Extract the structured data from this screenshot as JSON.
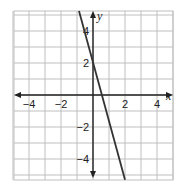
{
  "chart_data": {
    "type": "line",
    "title": "",
    "xlabel": "x",
    "ylabel": "y",
    "xlim": [
      -5,
      5
    ],
    "ylim": [
      -5.3,
      5.25
    ],
    "grid": true,
    "grid_step": 1,
    "x_ticks": [
      -4,
      -2,
      2,
      4
    ],
    "x_tick_labels": [
      "−4",
      "−2",
      "2",
      "4"
    ],
    "y_ticks": [
      4,
      2,
      -2,
      -4
    ],
    "y_tick_labels": [
      "4",
      "2",
      "−2",
      "−4"
    ],
    "series": [
      {
        "name": "line",
        "points": [
          [
            -0.875,
            5.25
          ],
          [
            0,
            2
          ],
          [
            0.57,
            0
          ],
          [
            2,
            -5.3
          ]
        ],
        "slope_approx": -3.5,
        "y_intercept": 2
      }
    ],
    "legend": null
  },
  "colors": {
    "grid": "#bfbfbf",
    "axis": "#222222",
    "line": "#333333",
    "background": "#ffffff"
  }
}
